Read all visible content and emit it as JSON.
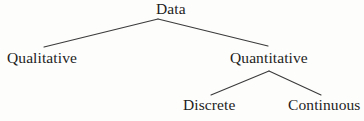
{
  "diagram": {
    "type": "tree",
    "background_color": "#fdfdfc",
    "line_color": "#3a3a3a",
    "text_color": "#1d1d1d",
    "nodes": [
      {
        "id": "data",
        "label": "Data",
        "level": 0,
        "x": 171,
        "y": 9
      },
      {
        "id": "qualitative",
        "label": "Qualitative",
        "level": 1,
        "x": 43,
        "y": 58
      },
      {
        "id": "quantitative",
        "label": "Quantitative",
        "level": 1,
        "x": 268,
        "y": 58
      },
      {
        "id": "discrete",
        "label": "Discrete",
        "level": 2,
        "x": 212,
        "y": 105
      },
      {
        "id": "continuous",
        "label": "Continuous",
        "level": 2,
        "x": 325,
        "y": 105
      }
    ],
    "edges": [
      {
        "id": "edge-data-qualitative",
        "from": "data",
        "to": "qualitative",
        "x1": 158,
        "y1": 19,
        "x2": 44,
        "y2": 47
      },
      {
        "id": "edge-data-quantitative",
        "from": "data",
        "to": "quantitative",
        "x1": 158,
        "y1": 19,
        "x2": 268,
        "y2": 46
      },
      {
        "id": "edge-quantitative-discrete",
        "from": "quantitative",
        "to": "discrete",
        "x1": 269,
        "y1": 71,
        "x2": 211,
        "y2": 95
      },
      {
        "id": "edge-quantitative-continuous",
        "from": "quantitative",
        "to": "continuous",
        "x1": 269,
        "y1": 71,
        "x2": 321,
        "y2": 95
      }
    ]
  }
}
